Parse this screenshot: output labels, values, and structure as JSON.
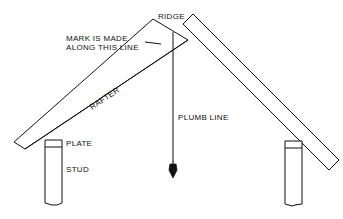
{
  "diagram": {
    "labels": {
      "ridge": "RIDGE",
      "mark_line1": "MARK IS MADE",
      "mark_line2": "ALONG THIS LINE",
      "rafter": "RAFTER",
      "plumb_line": "PLUMB LINE",
      "plate": "PLATE",
      "stud": "STUD"
    },
    "colors": {
      "ink": "#111111",
      "paper": "#ffffff"
    }
  }
}
